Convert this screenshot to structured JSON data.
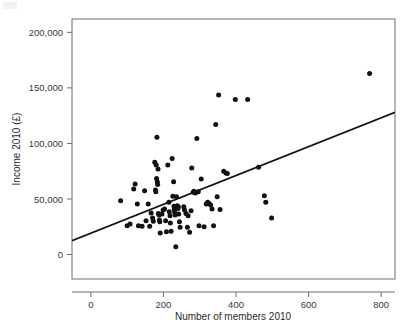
{
  "figure": {
    "background": "#ffffff",
    "point_color": "#111111",
    "line_color": "#111111",
    "frame_color": "#6f6f6f"
  },
  "chart_data": {
    "type": "scatter",
    "title": "",
    "subtitle": "",
    "xlabel": "Number of members 2010",
    "ylabel": "Income 2010 (£)",
    "xlim": [
      -52,
      838
    ],
    "ylim": [
      -22000,
      212000
    ],
    "xticks": [
      0,
      200,
      400,
      600,
      800
    ],
    "xticklabels": [
      "0",
      "200",
      "400",
      "600",
      "800"
    ],
    "yticks": [
      0,
      50000,
      100000,
      150000,
      200000
    ],
    "yticklabels": [
      "0",
      "50,000",
      "100,000",
      "150,000",
      "200,000"
    ],
    "grid": false,
    "legend": null,
    "annotations": [],
    "series": [
      {
        "name": "Organisations",
        "marker": "circle",
        "color": "#111111",
        "points": [
          [
            82,
            48500
          ],
          [
            100,
            26000
          ],
          [
            108,
            27500
          ],
          [
            118,
            59000
          ],
          [
            122,
            63500
          ],
          [
            128,
            45500
          ],
          [
            131,
            26000
          ],
          [
            141,
            25500
          ],
          [
            148,
            57500
          ],
          [
            152,
            30500
          ],
          [
            158,
            45500
          ],
          [
            162,
            25500
          ],
          [
            166,
            37500
          ],
          [
            170,
            33000
          ],
          [
            172,
            30000
          ],
          [
            176,
            83000
          ],
          [
            178,
            58000
          ],
          [
            179,
            56500
          ],
          [
            180,
            80500
          ],
          [
            181,
            68500
          ],
          [
            182,
            105500
          ],
          [
            183,
            65500
          ],
          [
            184,
            63000
          ],
          [
            185,
            77000
          ],
          [
            186,
            37000
          ],
          [
            188,
            35500
          ],
          [
            189,
            31000
          ],
          [
            190,
            29500
          ],
          [
            191,
            19500
          ],
          [
            196,
            36500
          ],
          [
            199,
            40000
          ],
          [
            203,
            41000
          ],
          [
            206,
            30500
          ],
          [
            208,
            20500
          ],
          [
            212,
            80500
          ],
          [
            215,
            47000
          ],
          [
            216,
            38500
          ],
          [
            218,
            35000
          ],
          [
            219,
            28500
          ],
          [
            221,
            21000
          ],
          [
            224,
            86500
          ],
          [
            226,
            52500
          ],
          [
            228,
            65500
          ],
          [
            229,
            43500
          ],
          [
            230,
            40500
          ],
          [
            231,
            38000
          ],
          [
            232,
            35500
          ],
          [
            234,
            7000
          ],
          [
            236,
            52000
          ],
          [
            238,
            44000
          ],
          [
            239,
            42500
          ],
          [
            240,
            41500
          ],
          [
            241,
            43000
          ],
          [
            242,
            36500
          ],
          [
            244,
            29500
          ],
          [
            246,
            24500
          ],
          [
            256,
            43000
          ],
          [
            258,
            40000
          ],
          [
            262,
            37000
          ],
          [
            266,
            24500
          ],
          [
            268,
            35000
          ],
          [
            272,
            20000
          ],
          [
            276,
            39500
          ],
          [
            278,
            78000
          ],
          [
            282,
            56000
          ],
          [
            284,
            57000
          ],
          [
            288,
            55500
          ],
          [
            292,
            104500
          ],
          [
            296,
            56500
          ],
          [
            298,
            26000
          ],
          [
            304,
            68000
          ],
          [
            312,
            25000
          ],
          [
            318,
            45500
          ],
          [
            322,
            47000
          ],
          [
            326,
            46000
          ],
          [
            330,
            44500
          ],
          [
            334,
            41000
          ],
          [
            338,
            26000
          ],
          [
            344,
            117000
          ],
          [
            348,
            52000
          ],
          [
            352,
            143500
          ],
          [
            356,
            40500
          ],
          [
            366,
            75000
          ],
          [
            372,
            73500
          ],
          [
            376,
            73000
          ],
          [
            398,
            139500
          ],
          [
            432,
            139500
          ],
          [
            462,
            78500
          ],
          [
            478,
            53000
          ],
          [
            482,
            47000
          ],
          [
            498,
            33000
          ],
          [
            768,
            163000
          ]
        ]
      }
    ],
    "fit_line": {
      "name": "linear fit",
      "x0": -52,
      "y0": 12500,
      "x1": 838,
      "y1": 128000,
      "slope": 129.8,
      "intercept": 19250
    }
  }
}
